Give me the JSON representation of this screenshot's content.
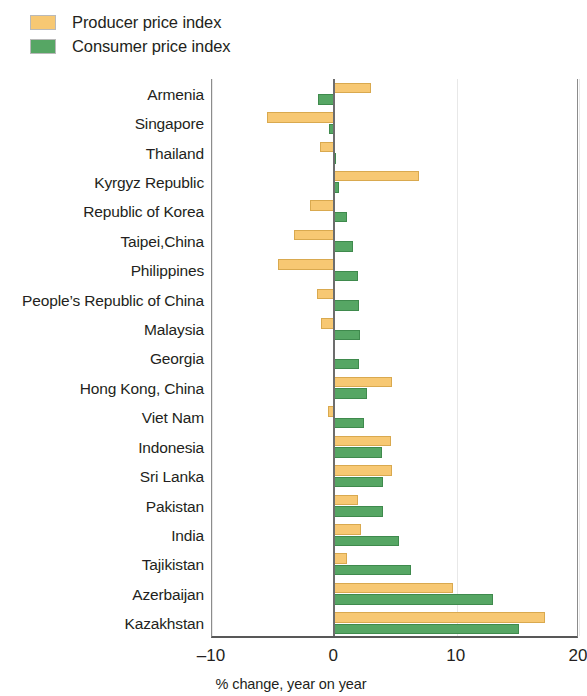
{
  "legend": {
    "items": [
      {
        "label": "Producer price index",
        "color": "#f7c873",
        "key": "ppi"
      },
      {
        "label": "Consumer price index",
        "color": "#56a664",
        "key": "cpi"
      }
    ]
  },
  "axis": {
    "title": "% change, year on year",
    "ticks": [
      "–10",
      "0",
      "10",
      "20"
    ],
    "tick_values": [
      -10,
      0,
      10,
      20
    ]
  },
  "chart_data": {
    "type": "bar",
    "orientation": "horizontal",
    "title": "",
    "subtitle": "",
    "xlabel": "% change, year on year",
    "ylabel": "",
    "xlim": [
      -10,
      20
    ],
    "xticks": [
      -10,
      0,
      10,
      20
    ],
    "grid": false,
    "legend_position": "top-left",
    "categories": [
      "Armenia",
      "Singapore",
      "Thailand",
      "Kyrgyz Republic",
      "Republic of Korea",
      "Taipei,China",
      "Philippines",
      "People’s Republic of China",
      "Malaysia",
      "Georgia",
      "Hong Kong, China",
      "Viet Nam",
      "Indonesia",
      "Sri Lanka",
      "Pakistan",
      "India",
      "Tajikistan",
      "Azerbaijan",
      "Kazakhstan"
    ],
    "series": [
      {
        "name": "Producer price index",
        "color": "#f7c873",
        "values": [
          3.0,
          -5.5,
          -1.2,
          6.9,
          -2.0,
          -3.3,
          -4.6,
          -1.4,
          -1.1,
          0.0,
          4.7,
          -0.5,
          4.6,
          4.7,
          1.9,
          2.2,
          1.0,
          9.7,
          17.2
        ]
      },
      {
        "name": "Consumer price index",
        "color": "#56a664",
        "values": [
          -1.3,
          -0.4,
          0.1,
          0.4,
          1.0,
          1.5,
          1.9,
          2.0,
          2.1,
          2.0,
          2.7,
          2.4,
          3.9,
          4.0,
          4.0,
          5.3,
          6.3,
          13.0,
          15.1
        ]
      }
    ]
  }
}
